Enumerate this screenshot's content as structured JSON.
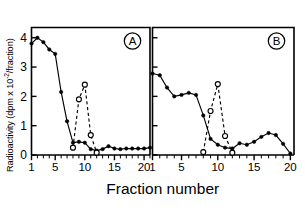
{
  "figure": {
    "title": "",
    "xlabel": "Fraction number",
    "ylabel_main": "Radioactivity (dpm x 10",
    "ylabel_exponent": "-2",
    "ylabel_tail": "/fraction)",
    "panel_a_label": "A",
    "panel_b_label": "B",
    "ytick_labels": [
      "0",
      "1",
      "2",
      "3",
      "4"
    ],
    "xtick_labels_a": [
      "1",
      "5",
      "10",
      "15",
      "20"
    ],
    "xtick_labels_b": [
      "1",
      "5",
      "10",
      "15",
      "20"
    ],
    "ink_color": "#000000",
    "background_color": "#ffffff"
  },
  "chart_data": [
    {
      "type": "line",
      "panel": "A",
      "title": "A",
      "xlabel": "Fraction number",
      "ylabel": "Radioactivity (dpm x 10^-2/fraction)",
      "xlim": [
        1,
        21
      ],
      "ylim": [
        0,
        4.35
      ],
      "xticks": [
        1,
        5,
        10,
        15,
        20
      ],
      "yticks": [
        0,
        1,
        2,
        3,
        4
      ],
      "grid": false,
      "legend": "none",
      "series": [
        {
          "name": "solid-filled-circles",
          "marker": "filled-circle",
          "linestyle": "solid",
          "x": [
            1,
            2,
            3,
            4,
            5,
            6,
            7,
            8,
            9,
            10,
            11,
            12,
            13,
            14,
            15,
            16,
            17,
            18,
            19,
            20,
            21
          ],
          "values": [
            3.8,
            4.0,
            3.85,
            3.6,
            3.45,
            2.15,
            1.15,
            0.42,
            0.45,
            0.42,
            0.2,
            0.15,
            0.2,
            0.3,
            0.22,
            0.2,
            0.22,
            0.22,
            0.22,
            0.22,
            0.25
          ]
        },
        {
          "name": "dashed-open-circles",
          "marker": "open-circle",
          "linestyle": "dashed",
          "x": [
            8,
            9,
            10,
            11,
            12
          ],
          "values": [
            0.25,
            1.9,
            2.4,
            0.68,
            0.08
          ]
        }
      ]
    },
    {
      "type": "line",
      "panel": "B",
      "title": "B",
      "xlabel": "Fraction number",
      "ylabel": "Radioactivity (dpm x 10^-2/fraction)",
      "xlim": [
        1,
        20.5
      ],
      "ylim": [
        0,
        4.35
      ],
      "xticks": [
        1,
        5,
        10,
        15,
        20
      ],
      "yticks": [
        0,
        1,
        2,
        3,
        4
      ],
      "grid": false,
      "legend": "none",
      "series": [
        {
          "name": "solid-filled-circles",
          "marker": "filled-circle",
          "linestyle": "solid",
          "x": [
            1,
            2,
            3,
            4,
            5,
            6,
            7,
            8,
            9,
            10,
            11,
            12,
            13,
            14,
            15,
            16,
            17,
            18,
            19,
            20
          ],
          "values": [
            2.78,
            2.72,
            2.3,
            2.0,
            2.05,
            2.12,
            2.05,
            1.35,
            0.55,
            0.35,
            0.25,
            0.22,
            0.4,
            0.35,
            0.45,
            0.62,
            0.75,
            0.68,
            0.38,
            0.05
          ]
        },
        {
          "name": "dashed-open-circles",
          "marker": "open-circle",
          "linestyle": "dashed",
          "x": [
            8,
            9,
            10,
            11,
            12
          ],
          "values": [
            0.1,
            1.5,
            2.42,
            0.65,
            0.08
          ]
        }
      ]
    }
  ]
}
